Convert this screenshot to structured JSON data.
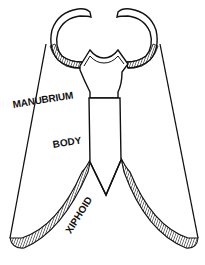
{
  "diagram": {
    "labels": {
      "manubrium": "MANUBRIUM",
      "body": "BODY",
      "xiphoid": "XIPHOID"
    },
    "colors": {
      "ink": "#111111",
      "background": "#ffffff"
    }
  }
}
